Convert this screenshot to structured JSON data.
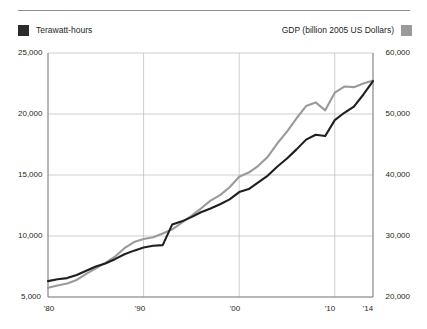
{
  "legend": {
    "left": {
      "label": "Terawatt-hours",
      "swatch_color": "#2b2b2b",
      "swatch_name": "electricity-swatch"
    },
    "right": {
      "label": "GDP (billion 2005 US Dollars)",
      "swatch_color": "#9a9a9a",
      "swatch_name": "gdp-swatch"
    }
  },
  "axes": {
    "y_left_ticks": [
      "25,000",
      "20,000",
      "15,000",
      "10,000",
      "5,000"
    ],
    "y_right_ticks": [
      "60,000",
      "50,000",
      "40,000",
      "30,000",
      "20,000"
    ],
    "x_ticks": [
      "'80",
      "'90",
      "'00",
      "'10",
      "'14"
    ]
  },
  "chart_data": {
    "type": "line",
    "title": "",
    "subtitle": "",
    "xlabel": "",
    "ylabel": "Terawatt-hours",
    "y2label": "GDP (billion 2005 US Dollars)",
    "grid": true,
    "legend_position": "top",
    "x": [
      1980,
      1981,
      1982,
      1983,
      1984,
      1985,
      1986,
      1987,
      1988,
      1989,
      1990,
      1991,
      1992,
      1993,
      1994,
      1995,
      1996,
      1997,
      1998,
      1999,
      2000,
      2001,
      2002,
      2003,
      2004,
      2005,
      2006,
      2007,
      2008,
      2009,
      2010,
      2011,
      2012,
      2013,
      2014
    ],
    "xlim": [
      1980,
      2014
    ],
    "xtick_labels": [
      "'80",
      "'90",
      "'00",
      "'10",
      "'14"
    ],
    "xtick_values": [
      1980,
      1990,
      2000,
      2010,
      2014
    ],
    "ylim": [
      5000,
      25000
    ],
    "ytick_values": [
      5000,
      10000,
      15000,
      20000,
      25000
    ],
    "ytick_labels": [
      "5,000",
      "10,000",
      "15,000",
      "20,000",
      "25,000"
    ],
    "y2lim": [
      20000,
      60000
    ],
    "y2tick_values": [
      20000,
      30000,
      40000,
      50000,
      60000
    ],
    "y2tick_labels": [
      "20,000",
      "30,000",
      "40,000",
      "50,000",
      "60,000"
    ],
    "series": [
      {
        "name": "Terawatt-hours",
        "axis": "left",
        "color": "#1f1f1f",
        "units": "TWh",
        "values": [
          6300,
          6450,
          6550,
          6800,
          7150,
          7500,
          7750,
          8100,
          8500,
          8800,
          9050,
          9200,
          9250,
          10950,
          11200,
          11550,
          11950,
          12250,
          12600,
          13000,
          13600,
          13850,
          14400,
          14950,
          15700,
          16350,
          17100,
          17900,
          18300,
          18200,
          19500,
          20100,
          20600,
          21600,
          22700
        ]
      },
      {
        "name": "GDP (billion 2005 US Dollars)",
        "axis": "right",
        "color": "#9a9a9a",
        "units": "billion 2005 US Dollars",
        "values": [
          21500,
          21900,
          22200,
          22800,
          23800,
          24700,
          25600,
          26600,
          28000,
          29000,
          29500,
          29800,
          30400,
          31100,
          32200,
          33300,
          34500,
          35800,
          36700,
          38000,
          39700,
          40400,
          41500,
          43000,
          45200,
          47100,
          49300,
          51300,
          51900,
          50600,
          53500,
          54500,
          54400,
          55000,
          55500
        ]
      }
    ]
  }
}
